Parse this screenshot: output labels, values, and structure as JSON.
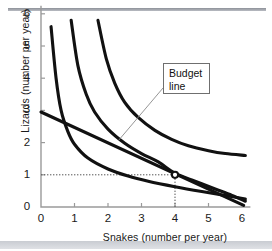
{
  "figure": {
    "annotation": {
      "line1": "Budget",
      "line2": "line"
    }
  },
  "chart_data": {
    "type": "line",
    "title": "",
    "xlabel": "Snakes (number per year)",
    "ylabel": "Lizards (number per year)",
    "xlim": [
      0,
      6.2
    ],
    "ylim": [
      0,
      6.2
    ],
    "xticks": [
      0,
      1,
      2,
      3,
      4,
      5,
      6
    ],
    "yticks": [
      0,
      1,
      2,
      3,
      4,
      5,
      6
    ],
    "xticklabels": [
      "0",
      "1",
      "2",
      "3",
      "4",
      "5",
      "6"
    ],
    "yticklabels": [
      "0",
      "1",
      "2",
      "3",
      "4",
      "5",
      "6"
    ],
    "grid": false,
    "legend": null,
    "series": [
      {
        "name": "indifference-curve-1",
        "note": "lowest indifference curve",
        "points": [
          [
            0.3,
            5.6
          ],
          [
            0.45,
            4.0
          ],
          [
            0.6,
            3.0
          ],
          [
            0.8,
            2.35
          ],
          [
            1.0,
            1.95
          ],
          [
            1.4,
            1.52
          ],
          [
            2.0,
            1.18
          ],
          [
            2.6,
            0.96
          ],
          [
            3.2,
            0.8
          ],
          [
            4.0,
            0.63
          ],
          [
            4.8,
            0.48
          ],
          [
            5.5,
            0.36
          ],
          [
            6.1,
            0.25
          ]
        ]
      },
      {
        "name": "indifference-curve-2",
        "note": "middle indifference curve, tangent to budget line at (4,1)",
        "points": [
          [
            0.9,
            5.8
          ],
          [
            1.1,
            4.4
          ],
          [
            1.35,
            3.5
          ],
          [
            1.6,
            2.95
          ],
          [
            2.0,
            2.42
          ],
          [
            2.5,
            1.98
          ],
          [
            3.0,
            1.66
          ],
          [
            3.5,
            1.4
          ],
          [
            4.0,
            1.05
          ],
          [
            4.6,
            0.8
          ],
          [
            5.2,
            0.56
          ],
          [
            5.7,
            0.36
          ],
          [
            6.1,
            0.18
          ]
        ]
      },
      {
        "name": "indifference-curve-3",
        "note": "highest indifference curve",
        "points": [
          [
            1.7,
            5.8
          ],
          [
            1.95,
            4.6
          ],
          [
            2.2,
            3.85
          ],
          [
            2.5,
            3.25
          ],
          [
            2.9,
            2.78
          ],
          [
            3.4,
            2.38
          ],
          [
            3.9,
            2.1
          ],
          [
            4.4,
            1.9
          ],
          [
            5.0,
            1.75
          ],
          [
            5.5,
            1.66
          ],
          [
            6.1,
            1.6
          ]
        ]
      },
      {
        "name": "budget-line",
        "note": "straight budget constraint",
        "points": [
          [
            0.0,
            2.95
          ],
          [
            6.05,
            0.05
          ]
        ]
      }
    ],
    "annotations": [
      {
        "text": "Budget line",
        "target_x": 2.3,
        "target_y": 2.05
      }
    ],
    "markers": [
      {
        "name": "best-affordable-point",
        "x": 4,
        "y": 1,
        "style": "open-circle"
      }
    ],
    "guides": [
      {
        "name": "horizontal-guide",
        "from": [
          0,
          1
        ],
        "to": [
          4,
          1
        ],
        "style": "dotted"
      },
      {
        "name": "vertical-guide",
        "from": [
          4,
          0
        ],
        "to": [
          4,
          1
        ],
        "style": "dotted"
      }
    ]
  }
}
